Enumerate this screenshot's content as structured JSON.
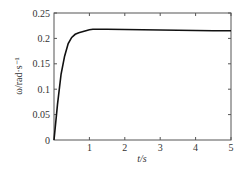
{
  "chart_data": {
    "type": "line",
    "title": "",
    "xlabel": "t/s",
    "ylabel": "ω/rad·s⁻¹",
    "xlim": [
      0,
      5
    ],
    "ylim": [
      0,
      0.25
    ],
    "xticks": [
      1,
      2,
      3,
      4,
      5
    ],
    "xtick_labels": [
      "1",
      "2",
      "3",
      "4",
      "5"
    ],
    "yticks": [
      0,
      0.05,
      0.1,
      0.15,
      0.2,
      0.25
    ],
    "ytick_labels": [
      "0",
      "0.05",
      "0.1",
      "0.15",
      "0.2",
      "0.25"
    ],
    "origin_label": "0",
    "grid": false,
    "legend": null,
    "series": [
      {
        "name": "ω",
        "color": "#111111",
        "x": [
          0,
          0.1,
          0.2,
          0.3,
          0.4,
          0.5,
          0.6,
          0.7,
          0.8,
          0.9,
          1.0,
          1.1,
          1.2,
          1.5,
          2.0,
          2.5,
          3.0,
          3.5,
          4.0,
          4.5,
          5.0
        ],
        "y": [
          0,
          0.07,
          0.13,
          0.165,
          0.19,
          0.202,
          0.208,
          0.211,
          0.213,
          0.215,
          0.217,
          0.218,
          0.218,
          0.218,
          0.2175,
          0.217,
          0.2165,
          0.216,
          0.2155,
          0.215,
          0.215
        ]
      }
    ]
  }
}
